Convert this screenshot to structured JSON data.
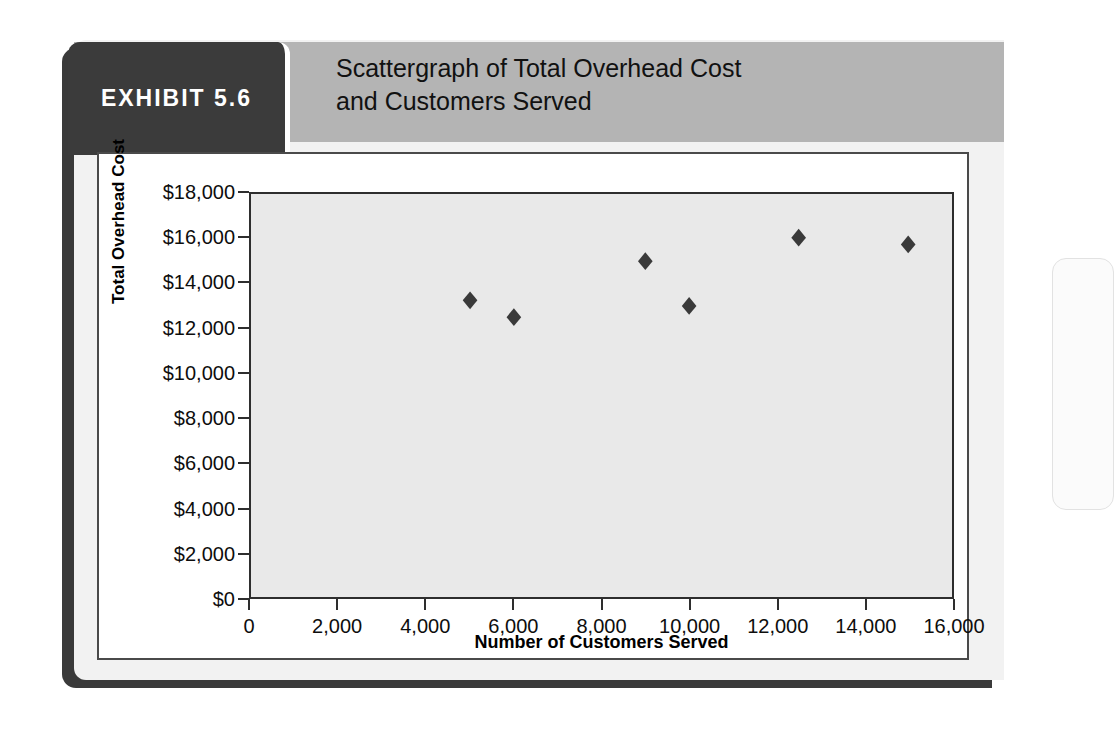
{
  "exhibit": {
    "badge_label": "EXHIBIT 5.6",
    "title_line_1": "Scattergraph of Total Overhead Cost",
    "title_line_2": "and Customers Served"
  },
  "colors": {
    "badge_background": "#3b3b3b",
    "title_band": "#b4b4b4",
    "plot_background": "#e9e9e9",
    "marker": "#3a3a3a",
    "axis": "#2e2e2e"
  },
  "chart_data": {
    "type": "scatter",
    "title": "Scattergraph of Total Overhead Cost and Customers Served",
    "xlabel": "Number of Customers Served",
    "ylabel": "Total Overhead Cost",
    "xlim": [
      0,
      16000
    ],
    "ylim": [
      0,
      18000
    ],
    "grid": false,
    "legend": false,
    "marker_shape": "diamond",
    "x_ticks": [
      0,
      2000,
      4000,
      6000,
      8000,
      10000,
      12000,
      14000,
      16000
    ],
    "x_tick_labels": [
      "0",
      "2,000",
      "4,000",
      "6,000",
      "8,000",
      "10,000",
      "12,000",
      "14,000",
      "16,000"
    ],
    "y_ticks": [
      0,
      2000,
      4000,
      6000,
      8000,
      10000,
      12000,
      14000,
      16000,
      18000
    ],
    "y_tick_labels": [
      "$0",
      "$2,000",
      "$4,000",
      "$6,000",
      "$8,000",
      "$10,000",
      "$12,000",
      "$14,000",
      "$16,000",
      "$18,000"
    ],
    "points": [
      {
        "x": 5000,
        "y": 13250
      },
      {
        "x": 6000,
        "y": 12500
      },
      {
        "x": 9000,
        "y": 15000
      },
      {
        "x": 10000,
        "y": 13000
      },
      {
        "x": 12500,
        "y": 16050
      },
      {
        "x": 15000,
        "y": 15750
      }
    ]
  }
}
